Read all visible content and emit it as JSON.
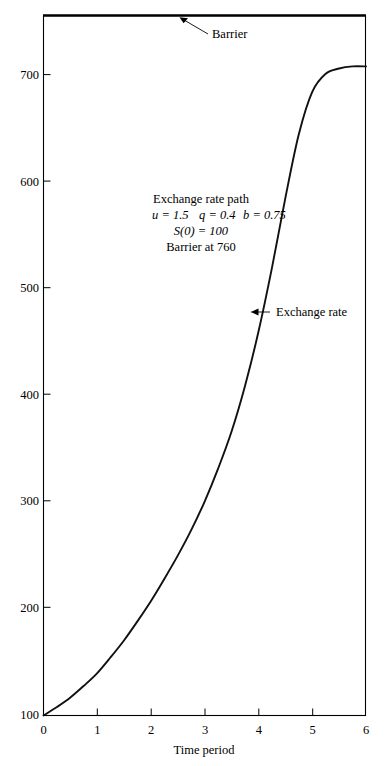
{
  "chart_data": {
    "type": "line",
    "title": "",
    "xlabel": "Time period",
    "ylabel": "",
    "xlim": [
      0,
      6
    ],
    "ylim": [
      100,
      760
    ],
    "grid": false,
    "legend": "none",
    "xticks": [
      "0",
      "1",
      "2",
      "3",
      "4",
      "5",
      "6"
    ],
    "xtick_values": [
      0,
      1,
      2,
      3,
      4,
      5,
      6
    ],
    "yticks": [
      "100",
      "200",
      "300",
      "400",
      "500",
      "600",
      "700"
    ],
    "ytick_values": [
      100,
      200,
      300,
      400,
      500,
      600,
      700
    ],
    "series": [
      {
        "name": "Exchange rate",
        "x": [
          0.0,
          0.25,
          0.5,
          0.75,
          1.0,
          1.25,
          1.5,
          1.75,
          2.0,
          2.25,
          2.5,
          2.75,
          3.0,
          3.25,
          3.5,
          3.75,
          4.0,
          4.25,
          4.5,
          4.75,
          5.0,
          5.25,
          5.5,
          5.75,
          6.0
        ],
        "values": [
          100,
          108,
          117,
          128,
          140,
          155,
          171,
          189,
          208,
          229,
          251,
          275,
          302,
          333,
          368,
          411,
          462,
          522,
          588,
          648,
          688,
          705,
          710,
          712,
          712
        ]
      },
      {
        "name": "Barrier",
        "x": [
          0,
          6
        ],
        "values": [
          760,
          760
        ]
      }
    ],
    "annotations": [
      {
        "id": "barrier-label",
        "text": "Barrier",
        "x": 3.1,
        "y": 738
      },
      {
        "id": "exchange-rate-label",
        "text": "Exchange rate",
        "x": 5.1,
        "y": 478
      }
    ],
    "note_block": {
      "lines": [
        "Exchange rate path",
        "u = 1.5    q = 0.4    b = 0.75",
        "S(0) = 100",
        "Barrier at 760"
      ],
      "line1": "Exchange rate path",
      "line2_u": "u = 1.5",
      "line2_q": "q = 0.4",
      "line2_b": "b = 0.75",
      "line3": "S(0) = 100",
      "line4": "Barrier at 760"
    },
    "parameters": {
      "u": 1.5,
      "q": 0.4,
      "b": 0.75,
      "S0": 100,
      "barrier": 760
    },
    "colors": {
      "curve": "#111111",
      "barrier": "#000000",
      "frame": "#000000",
      "background": "#ffffff",
      "text": "#000000"
    }
  }
}
